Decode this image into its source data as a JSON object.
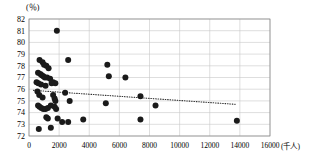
{
  "chart_data": {
    "type": "scatter",
    "title": "",
    "subtitle": "",
    "xlabel": "(千人)",
    "ylabel": "(％)",
    "xlim": [
      0,
      16000
    ],
    "ylim": [
      72,
      82
    ],
    "xticks": [
      0,
      2000,
      4000,
      6000,
      8000,
      10000,
      12000,
      14000,
      16000
    ],
    "xtick_labels": [
      "0",
      "2000",
      "4000",
      "6000",
      "8000",
      "10000",
      "12000",
      "14000",
      "16000"
    ],
    "yticks": [
      72,
      73,
      74,
      75,
      76,
      77,
      78,
      79,
      80,
      81,
      82
    ],
    "ytick_labels": [
      "72",
      "73",
      "74",
      "75",
      "76",
      "77",
      "78",
      "79",
      "80",
      "81",
      "82"
    ],
    "grid": true,
    "legend": null,
    "marker_color": "#1a1a1a",
    "marker_size": 3.0,
    "grid_color": "#c8c8c8",
    "axis_color": "#808080",
    "trendline": {
      "style": "dotted",
      "color": "#333333",
      "x_start": 300,
      "y_start": 75.9,
      "x_end": 13800,
      "y_end": 74.7
    },
    "points": [
      {
        "x": 1850,
        "y": 81.0
      },
      {
        "x": 700,
        "y": 78.5
      },
      {
        "x": 900,
        "y": 78.3
      },
      {
        "x": 1000,
        "y": 78.1
      },
      {
        "x": 1150,
        "y": 78.0
      },
      {
        "x": 1300,
        "y": 77.8
      },
      {
        "x": 2600,
        "y": 78.5
      },
      {
        "x": 5200,
        "y": 78.1
      },
      {
        "x": 600,
        "y": 77.4
      },
      {
        "x": 750,
        "y": 77.3
      },
      {
        "x": 850,
        "y": 77.2
      },
      {
        "x": 950,
        "y": 77.1
      },
      {
        "x": 1050,
        "y": 77.0
      },
      {
        "x": 1200,
        "y": 77.0
      },
      {
        "x": 1400,
        "y": 76.9
      },
      {
        "x": 1600,
        "y": 76.6
      },
      {
        "x": 1750,
        "y": 76.5
      },
      {
        "x": 5300,
        "y": 77.1
      },
      {
        "x": 6400,
        "y": 77.0
      },
      {
        "x": 500,
        "y": 76.6
      },
      {
        "x": 620,
        "y": 76.5
      },
      {
        "x": 800,
        "y": 76.4
      },
      {
        "x": 1100,
        "y": 76.3
      },
      {
        "x": 1500,
        "y": 76.5
      },
      {
        "x": 2400,
        "y": 75.7
      },
      {
        "x": 7400,
        "y": 75.4
      },
      {
        "x": 560,
        "y": 75.8
      },
      {
        "x": 680,
        "y": 75.5
      },
      {
        "x": 900,
        "y": 75.3
      },
      {
        "x": 1600,
        "y": 75.5
      },
      {
        "x": 1700,
        "y": 75.2
      },
      {
        "x": 1750,
        "y": 75.0
      },
      {
        "x": 2700,
        "y": 75.0
      },
      {
        "x": 5100,
        "y": 74.8
      },
      {
        "x": 600,
        "y": 74.6
      },
      {
        "x": 700,
        "y": 74.5
      },
      {
        "x": 820,
        "y": 74.4
      },
      {
        "x": 950,
        "y": 74.3
      },
      {
        "x": 1100,
        "y": 74.3
      },
      {
        "x": 1250,
        "y": 74.4
      },
      {
        "x": 1450,
        "y": 74.6
      },
      {
        "x": 1700,
        "y": 74.5
      },
      {
        "x": 1800,
        "y": 74.3
      },
      {
        "x": 8400,
        "y": 74.6
      },
      {
        "x": 1150,
        "y": 73.6
      },
      {
        "x": 1250,
        "y": 73.5
      },
      {
        "x": 1900,
        "y": 73.5
      },
      {
        "x": 2200,
        "y": 73.2
      },
      {
        "x": 2600,
        "y": 73.2
      },
      {
        "x": 3600,
        "y": 73.4
      },
      {
        "x": 7400,
        "y": 73.4
      },
      {
        "x": 13800,
        "y": 73.3
      },
      {
        "x": 650,
        "y": 72.6
      },
      {
        "x": 1450,
        "y": 72.7
      }
    ]
  }
}
